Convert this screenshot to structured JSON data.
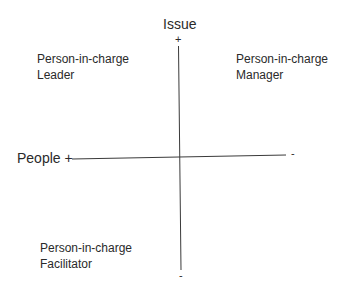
{
  "diagram": {
    "type": "quadrant",
    "vertical_axis": {
      "title": "Issue",
      "top_sign": "+",
      "bottom_sign": "-"
    },
    "horizontal_axis": {
      "left_label": "People +",
      "right_sign": "-"
    },
    "quadrants": {
      "top_left": {
        "line1": "Person-in-charge",
        "line2": "Leader"
      },
      "top_right": {
        "line1": "Person-in-charge",
        "line2": "Manager"
      },
      "bottom_left": {
        "line1": "Person-in-charge",
        "line2": "Facilitator"
      }
    },
    "colors": {
      "line": "#3a3a3a",
      "text": "#2a2a2a",
      "background": "#ffffff"
    }
  }
}
